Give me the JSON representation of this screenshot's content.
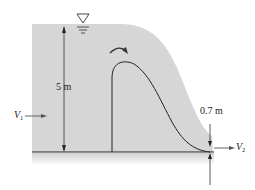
{
  "diagram": {
    "type": "flow over a weir / spillway",
    "labels": {
      "upstream_depth": "5 m",
      "downstream_depth": "0.7 m",
      "upstream_velocity_symbol": "V",
      "upstream_velocity_subscript": "1",
      "downstream_velocity_symbol": "V",
      "downstream_velocity_subscript": "2"
    },
    "symbols": {
      "free_surface": "inverted-triangle-water-level-marker",
      "flow_direction": "curved-arrow-over-crest"
    },
    "colors": {
      "water": "#d6d6d6",
      "bed_shadow": "#e4e4e4",
      "lines": "#222222",
      "background": "#ffffff"
    }
  }
}
